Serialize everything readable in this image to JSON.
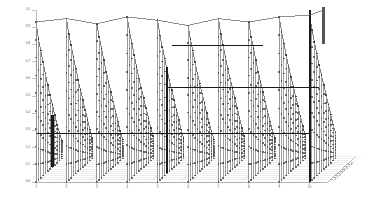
{
  "figure": {
    "title": "",
    "background_color": "#ffffff",
    "axis_color": "#8a8a8a",
    "stem_color": "#9a9a9a",
    "marker_color": "#3a3a3a",
    "panel_edge_color": "#555555",
    "highlight_color": "#1a1a1a",
    "width": 367,
    "height": 211
  },
  "chart_data": {
    "type": "scatter",
    "title": "",
    "xlabel": "",
    "ylabel": "",
    "zlabel": "",
    "grid": true,
    "legend": null,
    "projection": "3d",
    "xlim": [
      0,
      10
    ],
    "ylim": [
      0,
      1
    ],
    "zlim": [
      0,
      10
    ],
    "x_ticks": [
      "1",
      "2",
      "3",
      "4",
      "5",
      "6",
      "7",
      "8",
      "9",
      "10"
    ],
    "y_ticks": [
      "1.0",
      "0.9",
      "0.8",
      "0.7",
      "0.6",
      "0.5",
      "0.4",
      "0.3",
      "0.2",
      "0.1",
      "0.0"
    ],
    "z_ticks": [
      "1",
      "2",
      "3",
      "4",
      "5",
      "6",
      "7",
      "8"
    ],
    "series": [
      {
        "name": "group-1",
        "x": 1,
        "values": [
          0.93,
          0.82,
          0.74,
          0.66,
          0.58,
          0.5,
          0.43,
          0.36,
          0.29,
          0.22,
          0.16,
          0.1
        ]
      },
      {
        "name": "group-2",
        "x": 2,
        "values": [
          0.95,
          0.85,
          0.77,
          0.69,
          0.61,
          0.53,
          0.46,
          0.39,
          0.32,
          0.25,
          0.18,
          0.12
        ]
      },
      {
        "name": "group-3",
        "x": 3,
        "values": [
          0.92,
          0.83,
          0.75,
          0.67,
          0.59,
          0.52,
          0.45,
          0.38,
          0.31,
          0.24,
          0.17,
          0.11
        ]
      },
      {
        "name": "group-4",
        "x": 4,
        "values": [
          0.96,
          0.86,
          0.78,
          0.7,
          0.62,
          0.54,
          0.47,
          0.4,
          0.33,
          0.26,
          0.19,
          0.13
        ]
      },
      {
        "name": "group-5",
        "x": 5,
        "values": [
          0.94,
          0.84,
          0.76,
          0.68,
          0.6,
          0.53,
          0.46,
          0.39,
          0.32,
          0.25,
          0.18,
          0.12
        ]
      },
      {
        "name": "group-6",
        "x": 6,
        "values": [
          0.91,
          0.82,
          0.74,
          0.66,
          0.58,
          0.51,
          0.44,
          0.37,
          0.3,
          0.23,
          0.17,
          0.11
        ]
      },
      {
        "name": "group-7",
        "x": 7,
        "values": [
          0.95,
          0.85,
          0.77,
          0.69,
          0.61,
          0.54,
          0.47,
          0.4,
          0.33,
          0.26,
          0.19,
          0.13
        ]
      },
      {
        "name": "group-8",
        "x": 8,
        "values": [
          0.93,
          0.83,
          0.75,
          0.67,
          0.59,
          0.52,
          0.45,
          0.38,
          0.31,
          0.24,
          0.18,
          0.12
        ]
      },
      {
        "name": "group-9",
        "x": 9,
        "values": [
          0.96,
          0.86,
          0.78,
          0.7,
          0.62,
          0.55,
          0.48,
          0.41,
          0.34,
          0.27,
          0.2,
          0.14
        ]
      },
      {
        "name": "group-10",
        "x": 10,
        "values": [
          0.97,
          0.87,
          0.79,
          0.71,
          0.63,
          0.56,
          0.49,
          0.42,
          0.35,
          0.28,
          0.21,
          0.15
        ]
      }
    ],
    "highlights": [
      {
        "name": "tall-right-stem",
        "x": 10,
        "z": 1,
        "value": 1.0
      },
      {
        "name": "dark-left-stem",
        "x": 1,
        "z": 8,
        "value": 0.3
      },
      {
        "name": "dark-center-stem",
        "x": 5,
        "z": 5,
        "value": 0.62
      },
      {
        "name": "reference-line-low",
        "value": 0.28
      },
      {
        "name": "reference-line-mid",
        "value": 0.5
      },
      {
        "name": "reference-line-high",
        "value": 0.72
      }
    ]
  }
}
